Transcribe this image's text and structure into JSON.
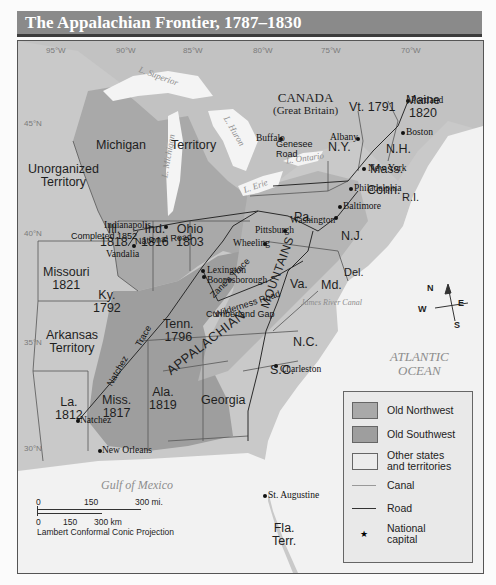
{
  "title": "The Appalachian Frontier, 1787–1830",
  "graticule": {
    "longitudes": [
      "95°W",
      "90°W",
      "85°W",
      "80°W",
      "75°W",
      "70°W"
    ],
    "latitudes": [
      "45°N",
      "40°N",
      "35°N",
      "30°N"
    ]
  },
  "regions": {
    "canada": "CANADA",
    "canada_sub": "(Great Britain)",
    "unorganized_1": "Unorganized",
    "unorganized_2": "Territory",
    "michigan": "Michigan",
    "michigan_territory": "Territory",
    "missouri": "Missouri",
    "missouri_year": "1821",
    "arkansas_1": "Arkansas",
    "arkansas_2": "Territory",
    "la": "La.",
    "la_year": "1812",
    "ill": "Ill.",
    "ill_year": "1818",
    "ind": "Ind.",
    "ind_year": "1816",
    "ohio": "Ohio",
    "ohio_year": "1803",
    "ky": "Ky.",
    "ky_year": "1792",
    "tenn": "Tenn.",
    "tenn_year": "1796",
    "miss": "Miss.",
    "miss_year": "1817",
    "ala": "Ala.",
    "ala_year": "1819",
    "georgia": "Georgia",
    "fla_1": "Fla.",
    "fla_2": "Terr.",
    "sc": "S.C.",
    "nc": "N.C.",
    "va": "Va.",
    "md": "Md.",
    "del": "Del.",
    "nj": "N.J.",
    "pa": "Pa.",
    "ny": "N.Y.",
    "vt": "Vt. 1791",
    "nh": "N.H.",
    "mass": "Mass.",
    "conn": "Conn.",
    "ri": "R.I.",
    "maine": "Maine",
    "maine_year": "1820"
  },
  "mountains": {
    "appalachian": "APPALACHIAN",
    "mountains": "MOUNTAINS"
  },
  "water": {
    "superior": "L. Superior",
    "michigan": "L. Michigan",
    "huron": "L. Huron",
    "erie": "L. Erie",
    "ontario": "L. Ontario",
    "atlantic_1": "ATLANTIC",
    "atlantic_2": "OCEAN",
    "gulf": "Gulf of Mexico"
  },
  "cities": {
    "portland": "Portland",
    "boston": "Boston",
    "albany": "Albany",
    "buffalo": "Buffalo",
    "new_york": "New York",
    "philadelphia": "Philadelphia",
    "baltimore": "Baltimore",
    "washington": "Washington",
    "pittsburgh": "Pittsburgh",
    "wheeling": "Wheeling",
    "indianapolis": "Indianapolis",
    "vandalia": "Vandalia",
    "lexington": "Lexington",
    "boonesborough": "Boonesborough",
    "charleston": "Charleston",
    "st_augustine": "St. Augustine",
    "natchez": "Natchez",
    "new_orleans": "New Orleans"
  },
  "routes": {
    "genesee_1": "Genesee",
    "genesee_2": "Road",
    "national_road": "National Road",
    "completed": "Completed 1852",
    "zanes_trace": "Zane's Trace",
    "wilderness_road": "Wilderness Road",
    "cumberland_gap": "Cumberland Gap",
    "natchez_trace_1": "Natchez",
    "natchez_trace_2": "Trace",
    "james_river_canal": "James River Canal",
    "erie_canal": "Erie Canal",
    "pa_canal": "Pennsylvania Canal"
  },
  "compass": {
    "n": "N",
    "s": "S",
    "e": "E",
    "w": "W"
  },
  "legend": {
    "items": [
      {
        "label": "Old Northwest",
        "color": "#a9a9a9"
      },
      {
        "label": "Old Southwest",
        "color": "#9e9e9e"
      },
      {
        "label_1": "Other states",
        "label_2": "and territories",
        "color": "#e6e6e6"
      },
      {
        "label": "Canal"
      },
      {
        "label": "Road"
      },
      {
        "label_1": "National",
        "label_2": "capital",
        "symbol": "★"
      }
    ]
  },
  "scale": {
    "mi_0": "0",
    "mi_150": "150",
    "mi_300": "300 mi.",
    "km_0": "0",
    "km_150": "150",
    "km_300": "300 km",
    "projection": "Lambert Conformal Conic Projection"
  }
}
